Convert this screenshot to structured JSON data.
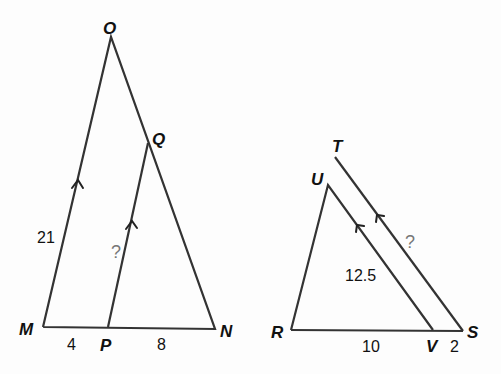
{
  "diagrams": [
    {
      "name": "triangle-OMN",
      "vertices": {
        "O": "O",
        "Q": "Q",
        "M": "M",
        "P": "P",
        "N": "N"
      },
      "labels": {
        "om": "21",
        "mp": "4",
        "pn": "8",
        "pq": "?"
      },
      "parallel": "OM ∥ QP"
    },
    {
      "name": "triangle-TRS",
      "vertices": {
        "T": "T",
        "U": "U",
        "R": "R",
        "V": "V",
        "S": "S"
      },
      "labels": {
        "uv": "12.5",
        "rv": "10",
        "vs": "2",
        "ts": "?"
      },
      "parallel": "UV ∥ TS"
    }
  ]
}
